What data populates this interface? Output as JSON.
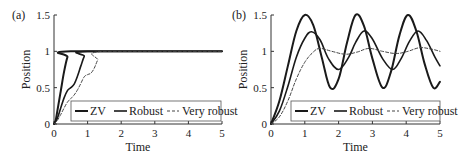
{
  "chart_data": [
    {
      "type": "line",
      "panel": "(a)",
      "xlabel": "Time",
      "ylabel": "Position",
      "xlim": [
        0,
        5
      ],
      "ylim": [
        0,
        1.5
      ],
      "xticks": [
        "0",
        "1",
        "2",
        "3",
        "4",
        "5"
      ],
      "yticks": [
        "0",
        "0.5",
        "1",
        "1.5"
      ],
      "grid": false,
      "legend_placement": "bottom-right",
      "series": [
        {
          "name": "ZV",
          "style": "solid-thick",
          "x": [
            0,
            0.05,
            0.1,
            0.2,
            0.3,
            0.4,
            0.5,
            5
          ],
          "y": [
            0,
            0.05,
            0.18,
            0.45,
            0.72,
            0.92,
            1.0,
            1.0
          ]
        },
        {
          "name": "Robust",
          "style": "solid",
          "x": [
            0,
            0.1,
            0.2,
            0.3,
            0.4,
            0.5,
            0.6,
            0.7,
            0.8,
            0.9,
            1.0,
            5
          ],
          "y": [
            0,
            0.08,
            0.22,
            0.36,
            0.46,
            0.5,
            0.55,
            0.66,
            0.8,
            0.93,
            1.0,
            1.0
          ]
        },
        {
          "name": "Very robust",
          "style": "dashed",
          "x": [
            0,
            0.1,
            0.2,
            0.3,
            0.4,
            0.5,
            0.6,
            0.7,
            0.8,
            0.9,
            1.0,
            1.1,
            1.2,
            1.3,
            1.45,
            5
          ],
          "y": [
            0,
            0.05,
            0.13,
            0.22,
            0.3,
            0.35,
            0.4,
            0.47,
            0.56,
            0.65,
            0.68,
            0.7,
            0.77,
            0.88,
            1.0,
            1.0
          ]
        }
      ]
    },
    {
      "type": "line",
      "panel": "(b)",
      "xlabel": "Time",
      "ylabel": "Position",
      "xlim": [
        0,
        5
      ],
      "ylim": [
        0,
        1.5
      ],
      "xticks": [
        "0",
        "1",
        "2",
        "3",
        "4",
        "5"
      ],
      "yticks": [
        "0",
        "0.5",
        "1",
        "1.5"
      ],
      "grid": false,
      "legend_placement": "bottom-right",
      "series": [
        {
          "name": "ZV",
          "style": "solid-thick",
          "model": "oscillation",
          "x": [
            0,
            0.25,
            0.5,
            0.75,
            1.0,
            1.25,
            1.5,
            1.75,
            2.0,
            2.25,
            2.5,
            2.75,
            3.0,
            3.3,
            3.55,
            3.8,
            4.05,
            4.3,
            4.55,
            4.8,
            5.0
          ],
          "y": [
            0,
            0.32,
            0.8,
            1.28,
            1.5,
            1.36,
            0.92,
            0.5,
            0.62,
            1.12,
            1.5,
            1.35,
            0.9,
            0.5,
            0.72,
            1.22,
            1.5,
            1.28,
            0.82,
            0.5,
            0.58
          ]
        },
        {
          "name": "Robust",
          "style": "solid",
          "model": "oscillation",
          "x": [
            0,
            0.25,
            0.5,
            0.75,
            1.0,
            1.2,
            1.45,
            1.7,
            2.0,
            2.3,
            2.5,
            2.75,
            3.0,
            3.3,
            3.6,
            3.85,
            4.1,
            4.35,
            4.6,
            4.85,
            5.0
          ],
          "y": [
            0,
            0.18,
            0.52,
            0.92,
            1.18,
            1.27,
            1.16,
            0.9,
            0.75,
            0.92,
            1.12,
            1.28,
            1.17,
            0.9,
            0.75,
            0.9,
            1.14,
            1.28,
            1.15,
            0.92,
            0.8
          ]
        },
        {
          "name": "Very robust",
          "style": "dashed",
          "model": "oscillation",
          "x": [
            0,
            0.25,
            0.5,
            0.75,
            1.0,
            1.25,
            1.45,
            1.8,
            2.2,
            2.55,
            2.9,
            3.3,
            3.7,
            4.05,
            4.4,
            4.75,
            5.0
          ],
          "y": [
            0,
            0.1,
            0.32,
            0.62,
            0.85,
            0.99,
            1.04,
            1.0,
            0.96,
            0.99,
            1.04,
            1.0,
            0.97,
            1.0,
            1.05,
            1.03,
            1.0
          ]
        }
      ]
    }
  ]
}
